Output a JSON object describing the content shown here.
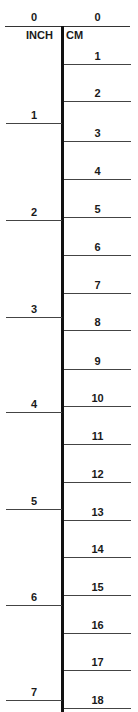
{
  "ruler": {
    "left_unit": "INCH",
    "right_unit": "CM",
    "zero_left": "0",
    "zero_right": "0",
    "top_line_y": 26,
    "spine_top": 26,
    "spine_bottom": 712,
    "cm_ticks": [
      {
        "label": "1",
        "y": 64
      },
      {
        "label": "2",
        "y": 101
      },
      {
        "label": "3",
        "y": 141
      },
      {
        "label": "4",
        "y": 179
      },
      {
        "label": "5",
        "y": 217
      },
      {
        "label": "6",
        "y": 255
      },
      {
        "label": "7",
        "y": 293
      },
      {
        "label": "8",
        "y": 330
      },
      {
        "label": "9",
        "y": 369
      },
      {
        "label": "10",
        "y": 406
      },
      {
        "label": "11",
        "y": 444
      },
      {
        "label": "12",
        "y": 482
      },
      {
        "label": "13",
        "y": 520
      },
      {
        "label": "14",
        "y": 557
      },
      {
        "label": "15",
        "y": 595
      },
      {
        "label": "16",
        "y": 633
      },
      {
        "label": "17",
        "y": 670
      },
      {
        "label": "18",
        "y": 708
      }
    ],
    "inch_ticks": [
      {
        "label": "1",
        "y": 123
      },
      {
        "label": "2",
        "y": 220
      },
      {
        "label": "3",
        "y": 317
      },
      {
        "label": "4",
        "y": 412
      },
      {
        "label": "5",
        "y": 509
      },
      {
        "label": "6",
        "y": 605
      },
      {
        "label": "7",
        "y": 700
      }
    ]
  }
}
